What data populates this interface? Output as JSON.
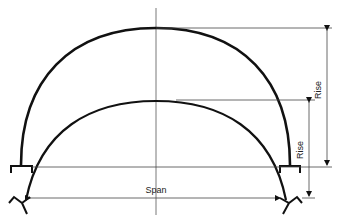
{
  "diagram": {
    "type": "arch-comparison",
    "labels": {
      "span": "Span",
      "outer_rise": "Rise",
      "inner_rise": "Rise"
    },
    "colors": {
      "stroke": "#111111",
      "thin": "#444444",
      "background": "#ffffff"
    },
    "arches": [
      {
        "name": "semicircular-arch",
        "description": "outer semicircular arch on flat supports"
      },
      {
        "name": "segmental-arch",
        "description": "inner lower arch on angled supports"
      }
    ]
  }
}
